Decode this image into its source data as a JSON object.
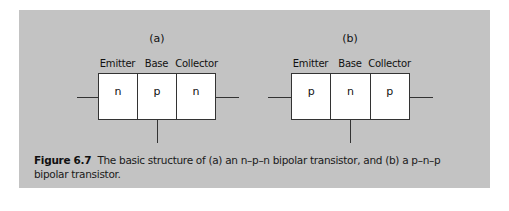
{
  "figure": {
    "panels": [
      {
        "title": "(a)",
        "type_name": "n-p-n",
        "regions": [
          {
            "label": "Emitter",
            "doping": "n"
          },
          {
            "label": "Base",
            "doping": "p"
          },
          {
            "label": "Collector",
            "doping": "n"
          }
        ]
      },
      {
        "title": "(b)",
        "type_name": "p-n-p",
        "regions": [
          {
            "label": "Emitter",
            "doping": "p"
          },
          {
            "label": "Base",
            "doping": "n"
          },
          {
            "label": "Collector",
            "doping": "p"
          }
        ]
      }
    ],
    "caption": {
      "number": "Figure 6.7",
      "text": "The basic structure of (a) an n–p–n bipolar transistor, and (b) a p–n–p bipolar transistor."
    },
    "colors": {
      "panel_background": "#c3c3c3",
      "box_fill": "#ffffff",
      "line": "#333333"
    }
  }
}
